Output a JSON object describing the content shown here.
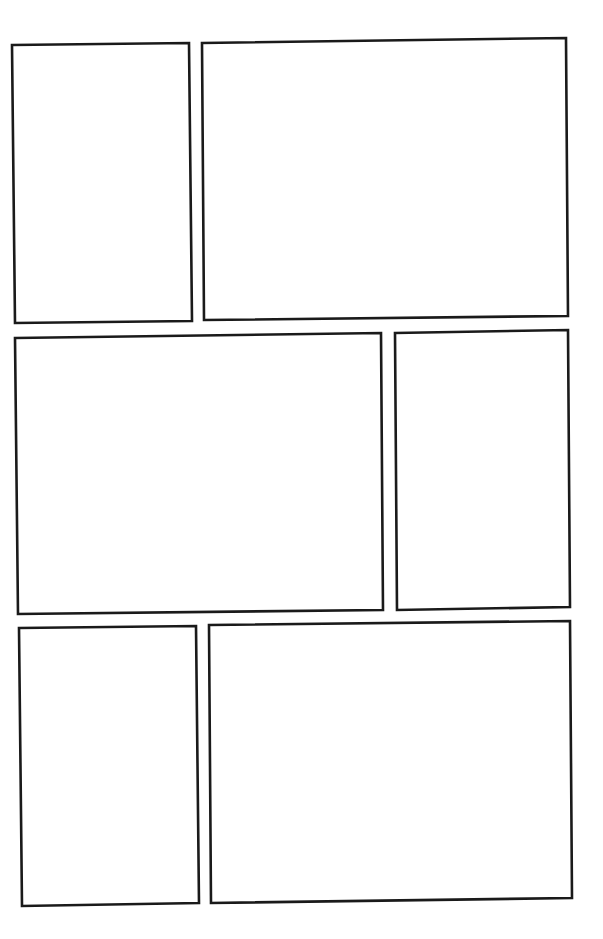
{
  "page": {
    "type": "blank-comic-page-template",
    "background": "#ffffff",
    "border_color": "#1a1a1a",
    "rows": 3,
    "panel_count": 6
  },
  "panels": [
    {
      "id": 1,
      "row": 1,
      "position": "left",
      "points": "12,45 189,43 192,321 15,323"
    },
    {
      "id": 2,
      "row": 1,
      "position": "right",
      "points": "202,43 566,38 568,316 204,320"
    },
    {
      "id": 3,
      "row": 2,
      "position": "left",
      "points": "15,338 381,333 383,610 18,614"
    },
    {
      "id": 4,
      "row": 2,
      "position": "right",
      "points": "395,333 568,330 570,607 397,610"
    },
    {
      "id": 5,
      "row": 3,
      "position": "left",
      "points": "19,628 196,626 199,903 22,906"
    },
    {
      "id": 6,
      "row": 3,
      "position": "right",
      "points": "209,625 570,621 572,898 211,903"
    }
  ]
}
